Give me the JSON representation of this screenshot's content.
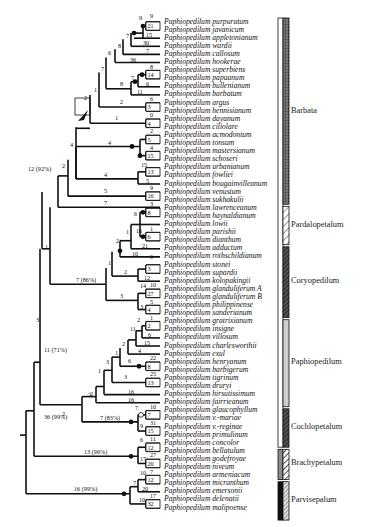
{
  "figure": {
    "type": "phylogenetic-tree",
    "genus": "Paphiopedilum",
    "taxa": [
      "Paphiopedilum purpuratum",
      "Paphiopedilum javanicum",
      "Paphiopedilum appletonianum",
      "Paphiopedilum wardii",
      "Paphiopedilum callosum",
      "Paphiopedilum hookerae",
      "Paphiopedilum superbiens",
      "Paphiopedilum papuanum",
      "Paphiopedilum bullenianum",
      "Paphiopedilum barbatum",
      "Paphiopedilum argus",
      "Paphiopedilum hennisianum",
      "Paphiopedilum dayanum",
      "Paphiopedilum ciliolare",
      "Paphiopedilum acmodontum",
      "Paphiopedilum tonsum",
      "Paphiopedilum mastersianum",
      "Paphiopedilum schoseri",
      "Paphiopedilum urbanianum",
      "Paphiopedilum fowliei",
      "Paphiopedilum bougainvilleanum",
      "Paphiopedilum venustum",
      "Paphiopedilum sukhakulii",
      "Paphiopedilum lawrenceanum",
      "Paphiopedilum haynaldianum",
      "Paphiopedilum lowii",
      "Paphiopedilum parishii",
      "Paphiopedilum dianthum",
      "Paphiopedilum adductum",
      "Paphiopedilum rothschildianum",
      "Paphiopedilum stonei",
      "Paphiopedilum supardii",
      "Paphiopedilum kolopakingii",
      "Paphiopedilum glanduliferum A",
      "Paphiopedilum glanduliferum B",
      "Paphiopedilum philippinense",
      "Paphiopedilum sanderianum",
      "Paphiopedilum gratrixianum",
      "Paphiopedilum insigne",
      "Paphiopedilum villosum",
      "Paphiopedilum charlesworthii",
      "Paphiopedilum exul",
      "Paphiopedilum henryanum",
      "Paphiopedilum barbigerum",
      "Paphiopedilum tigrinum",
      "Paphiopedilum druryi",
      "Paphiopedilum hirsutissimum",
      "Paphiopedilum fairrieanum",
      "Paphiopedilum glaucophyllum",
      "Paphiopedilum v.-mariae",
      "Paphiopedilum v.-reginae",
      "Paphiopedilum primulinum",
      "Paphiopedilum concolor",
      "Paphiopedilum bellatulum",
      "Paphiopedilum godefroyae",
      "Paphiopedilum niveum",
      "Paphiopedilum armeniacum",
      "Paphiopedilum micranthum",
      "Paphiopedilum emersonii",
      "Paphiopedilum delenatii",
      "Paphiopedilum malipoense"
    ],
    "subgenera": [
      {
        "label": "Barbata",
        "from": 0,
        "to": 22,
        "pattern": "dark-stipple"
      },
      {
        "label": "Pardalopetalum",
        "from": 23,
        "to": 27,
        "pattern": "hatch-light"
      },
      {
        "label": "Coryopedilum",
        "from": 28,
        "to": 36,
        "pattern": "hatch-dark"
      },
      {
        "label": "Paphiopedilum",
        "from": 37,
        "to": 47,
        "pattern": "light-gray"
      },
      {
        "label": "Cochlopetalum",
        "from": 48,
        "to": 52,
        "pattern": "hatch-dark"
      },
      {
        "label": "Brachypetalum",
        "from": 53,
        "to": 56,
        "pattern": "gray-hatch"
      },
      {
        "label": "Parvisepalum",
        "from": 57,
        "to": 61,
        "pattern": "black-hatch"
      }
    ],
    "bootstrap_annotations": [
      {
        "label": "12 (92%)"
      },
      {
        "label": "7 (86%)"
      },
      {
        "label": "11 (71%)"
      },
      {
        "label": "36 (99%)"
      },
      {
        "label": "7 (83%)"
      },
      {
        "label": "13 (96%)"
      },
      {
        "label": "16 (99%)"
      }
    ]
  }
}
